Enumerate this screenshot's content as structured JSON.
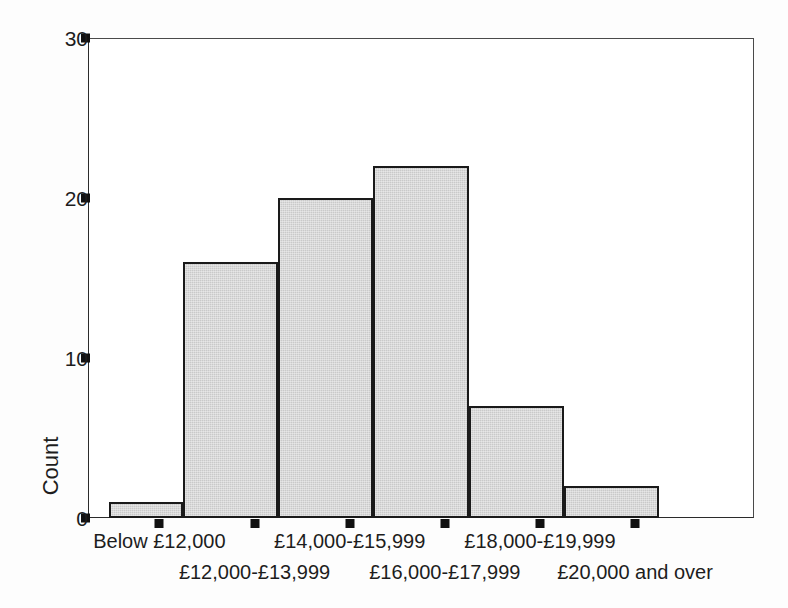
{
  "chart_data": {
    "type": "bar",
    "title": "",
    "subtitle": "",
    "xlabel": "",
    "ylabel": "Count",
    "categories": [
      "Below £12,000",
      "£12,000-£13,999",
      "£14,000-£15,999",
      "£16,000-£17,999",
      "£18,000-£19,999",
      "£20,000 and over"
    ],
    "values": [
      1,
      16,
      20,
      22,
      7,
      2
    ],
    "ylim": [
      0,
      30
    ],
    "xlim": [
      0,
      7
    ],
    "y_ticks": [
      0,
      10,
      20,
      30
    ],
    "y_tick_labels": [
      "0",
      "10",
      "20",
      "30"
    ],
    "grid": false,
    "legend": null,
    "legend_position": "none",
    "bar_fill_color": "#c9c9c9",
    "bar_edge_color": "#1a1a1a",
    "axis_color": "#2b2b2b",
    "text_color": "#1d1d1d",
    "background_color": "#fdfdfd",
    "plot_background_color": "#ffffff"
  },
  "axes": {
    "y": {
      "title": "Count",
      "ticks": [
        {
          "label": "30",
          "value": 30
        },
        {
          "label": "20",
          "value": 20
        },
        {
          "label": "10",
          "value": 10
        },
        {
          "label": "0",
          "value": 0
        }
      ]
    },
    "x": {
      "ticks": [
        {
          "label": "Below £12,000",
          "row": "a"
        },
        {
          "label": "£12,000-£13,999",
          "row": "b"
        },
        {
          "label": "£14,000-£15,999",
          "row": "a"
        },
        {
          "label": "£16,000-£17,999",
          "row": "b"
        },
        {
          "label": "£18,000-£19,999",
          "row": "a"
        },
        {
          "label": "£20,000 and over",
          "row": "b"
        }
      ]
    }
  }
}
